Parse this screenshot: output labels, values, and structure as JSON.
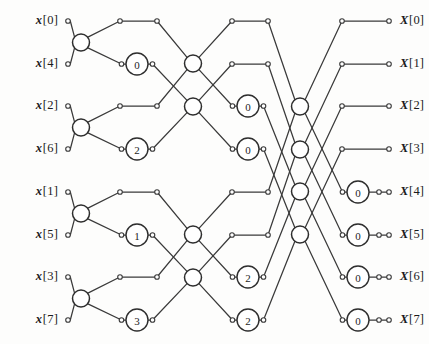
{
  "figure": {
    "kind": "fft-signal-flow-graph",
    "size": {
      "width": 429,
      "height": 344
    },
    "colors": {
      "line": "#3a3a3a",
      "node_stroke": "#2e2e2e",
      "node_fill": "#ffffff",
      "text": "#1b1b1b",
      "background": "#fdfdfc"
    }
  },
  "geometry": {
    "row_y": [
      21,
      64,
      106,
      149,
      192,
      235,
      277,
      320
    ],
    "x_in_dot": 68,
    "x_stage1_node": 81,
    "x_t1a": 120,
    "x_mult1": 137,
    "x_t1b": 157,
    "x_stage2_node": 193,
    "x_t2a": 232,
    "x_mult2": 248,
    "x_t2b": 268,
    "x_stage3_node": 300,
    "x_t3a": 342,
    "x_mult3": 358,
    "x_t3b": 379,
    "x_out_dot": 389,
    "node_r": 8.5,
    "mult_r": 11,
    "term_r": 2.3
  },
  "inputs": [
    {
      "v": "x",
      "br": "[0]",
      "row": 0
    },
    {
      "v": "x",
      "br": "[4]",
      "row": 1
    },
    {
      "v": "x",
      "br": "[2]",
      "row": 2
    },
    {
      "v": "x",
      "br": "[6]",
      "row": 3
    },
    {
      "v": "x",
      "br": "[1]",
      "row": 4
    },
    {
      "v": "x",
      "br": "[5]",
      "row": 5
    },
    {
      "v": "x",
      "br": "[3]",
      "row": 6
    },
    {
      "v": "x",
      "br": "[7]",
      "row": 7
    }
  ],
  "outputs": [
    {
      "v": "X",
      "br": "[0]",
      "row": 0
    },
    {
      "v": "X",
      "br": "[1]",
      "row": 1
    },
    {
      "v": "X",
      "br": "[2]",
      "row": 2
    },
    {
      "v": "X",
      "br": "[3]",
      "row": 3
    },
    {
      "v": "X",
      "br": "[4]",
      "row": 4
    },
    {
      "v": "X",
      "br": "[5]",
      "row": 5
    },
    {
      "v": "X",
      "br": "[6]",
      "row": 6
    },
    {
      "v": "X",
      "br": "[7]",
      "row": 7
    }
  ],
  "stages": [
    {
      "name": "stage-1",
      "adder_rows": [
        0,
        2,
        4,
        6
      ],
      "butterfly_pairs": [
        [
          0,
          1
        ],
        [
          2,
          3
        ],
        [
          4,
          5
        ],
        [
          6,
          7
        ]
      ],
      "multipliers": [
        {
          "row": 1,
          "label": "0"
        },
        {
          "row": 3,
          "label": "2"
        },
        {
          "row": 5,
          "label": "1"
        },
        {
          "row": 7,
          "label": "3"
        }
      ]
    },
    {
      "name": "stage-2",
      "adder_rows": [
        1,
        2,
        5,
        6
      ],
      "butterfly_pairs": [
        [
          0,
          2
        ],
        [
          1,
          3
        ],
        [
          4,
          6
        ],
        [
          5,
          7
        ]
      ],
      "multipliers": [
        {
          "row": 2,
          "label": "0"
        },
        {
          "row": 3,
          "label": "0"
        },
        {
          "row": 6,
          "label": "2"
        },
        {
          "row": 7,
          "label": "2"
        }
      ]
    },
    {
      "name": "stage-3",
      "adder_rows": [
        2,
        3,
        4,
        5
      ],
      "butterfly_pairs": [
        [
          0,
          4
        ],
        [
          1,
          5
        ],
        [
          2,
          6
        ],
        [
          3,
          7
        ]
      ],
      "multipliers": [
        {
          "row": 4,
          "label": "0"
        },
        {
          "row": 5,
          "label": "0"
        },
        {
          "row": 6,
          "label": "0"
        },
        {
          "row": 7,
          "label": "0"
        }
      ]
    }
  ]
}
